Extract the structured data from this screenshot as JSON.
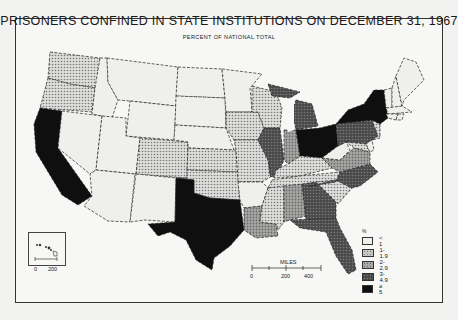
{
  "map": {
    "title": "PRISONERS CONFINED IN STATE INSTITUTIONS ON DECEMBER 31, 1967",
    "subtitle": "PERCENT OF NATIONAL TOTAL",
    "legend": {
      "unit": "%",
      "items": [
        {
          "label": "< 1",
          "color": "#efefec",
          "pattern": "none"
        },
        {
          "label": "1-1.9",
          "color": "#c8c8c6",
          "pattern": "light-dots"
        },
        {
          "label": "2-2.9",
          "color": "#9a9a98",
          "pattern": "medium-dots"
        },
        {
          "label": "3-4.9",
          "color": "#555555",
          "pattern": "dark-dots"
        },
        {
          "label": "≥ 5",
          "color": "#0f0f0f",
          "pattern": "solid"
        }
      ]
    },
    "scale": {
      "title": "MILES",
      "ticks": [
        "0",
        "200",
        "400"
      ]
    },
    "inset_scale": {
      "ticks": [
        "0",
        "200"
      ]
    },
    "classes": {
      "CA": "≥ 5",
      "TX": "≥ 5",
      "NY": "≥ 5",
      "OH": "≥ 5",
      "WA": "1-1.9",
      "OR": "1-1.9",
      "CO": "1-1.9",
      "KS": "1-1.9",
      "OK": "1-1.9",
      "IA": "1-1.9",
      "MO": "1-1.9",
      "WI": "1-1.9",
      "MN": "< 1",
      "KY": "1-1.9",
      "TN": "1-1.9",
      "MS": "1-1.9",
      "SC": "1-1.9",
      "MD": "1-1.9",
      "NJ": "1-1.9",
      "IN": "2-2.9",
      "LA": "2-2.9",
      "AL": "2-2.9",
      "VA": "2-2.9",
      "IL": "3-4.9",
      "MI": "3-4.9",
      "PA": "3-4.9",
      "NC": "3-4.9",
      "GA": "3-4.9",
      "FL": "3-4.9",
      "ID": "< 1",
      "MT": "< 1",
      "WY": "< 1",
      "NV": "< 1",
      "UT": "< 1",
      "AZ": "< 1",
      "NM": "< 1",
      "ND": "< 1",
      "SD": "< 1",
      "NE": "< 1",
      "AR": "< 1",
      "WV": "< 1",
      "ME": "< 1",
      "NH": "< 1",
      "VT": "< 1",
      "MA": "< 1",
      "CT": "< 1",
      "RI": "< 1",
      "DE": "< 1",
      "HI": "< 1"
    }
  }
}
